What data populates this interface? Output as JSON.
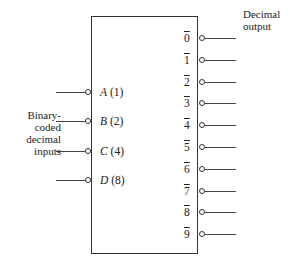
{
  "inputs": [
    {
      "letter": "A",
      "weight": "(1)"
    },
    {
      "letter": "B",
      "weight": "(2)"
    },
    {
      "letter": "C",
      "weight": "(4)"
    },
    {
      "letter": "D",
      "weight": "(8)"
    }
  ],
  "outputs": [
    "0",
    "1",
    "2",
    "3",
    "4",
    "5",
    "6",
    "7",
    "8",
    "9"
  ],
  "input_label": [
    "Binary-",
    "coded",
    "decimal",
    "inputs"
  ],
  "output_label": [
    "Decimal",
    "output"
  ]
}
